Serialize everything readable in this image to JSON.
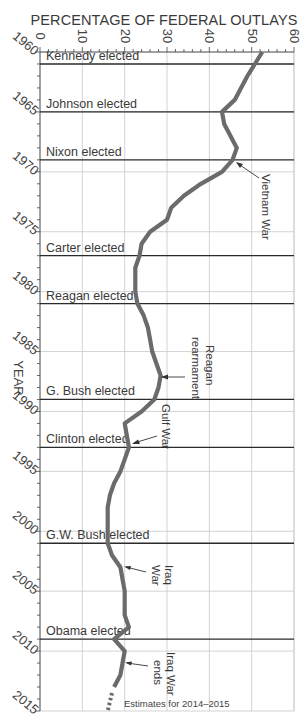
{
  "chart_data": {
    "type": "line",
    "orientation": "vertical (years on y-axis, top to bottom; percentage on x-axis)",
    "title": "PERCENTAGE OF FEDERAL OUTLAYS",
    "xlabel": "PERCENTAGE OF FEDERAL OUTLAYS",
    "ylabel": "YEAR",
    "xlim": [
      0,
      60
    ],
    "ylim": [
      1960,
      2015
    ],
    "x_ticks": [
      "0",
      "10",
      "20",
      "30",
      "40",
      "50",
      "60"
    ],
    "y_ticks": [
      "1960",
      "1965",
      "1970",
      "1975",
      "1980",
      "1985",
      "1990",
      "1995",
      "2000",
      "2005",
      "2010",
      "2015"
    ],
    "grid": true,
    "series": [
      {
        "name": "Defense spending as percentage of federal outlays",
        "x": [
          1960,
          1962,
          1964,
          1965,
          1966,
          1967,
          1968,
          1969,
          1970,
          1971,
          1972,
          1973,
          1974,
          1975,
          1976,
          1977,
          1978,
          1979,
          1980,
          1981,
          1982,
          1983,
          1984,
          1985,
          1986,
          1987,
          1988,
          1989,
          1990,
          1991,
          1992,
          1993,
          1994,
          1995,
          1996,
          1997,
          1998,
          1999,
          2000,
          2001,
          2002,
          2003,
          2004,
          2005,
          2006,
          2007,
          2008,
          2009,
          2010,
          2011,
          2012,
          2013
        ],
        "values": [
          52.5,
          49,
          46,
          43,
          43.5,
          45,
          46.5,
          45.5,
          43,
          38,
          34,
          31,
          30,
          26,
          24,
          23.5,
          22.5,
          22.5,
          22.5,
          23,
          24.5,
          25.5,
          26,
          26.5,
          27.5,
          28.5,
          28,
          27,
          24,
          20,
          20.5,
          21,
          20,
          19,
          17.5,
          16.5,
          16,
          16,
          16,
          16,
          17,
          19,
          19.5,
          20,
          20,
          20,
          21,
          17.5,
          20,
          19.5,
          19,
          17.5
        ]
      },
      {
        "name": "Estimates for 2014–2015 (dashed)",
        "x": [
          2013.5,
          2015
        ],
        "values": [
          17,
          16
        ]
      }
    ],
    "reference_lines": [
      {
        "label": "Kennedy elected",
        "year": 1961
      },
      {
        "label": "Johnson elected",
        "year": 1965
      },
      {
        "label": "Nixon elected",
        "year": 1969
      },
      {
        "label": "Carter elected",
        "year": 1977
      },
      {
        "label": "Reagan elected",
        "year": 1981
      },
      {
        "label": "G. Bush elected",
        "year": 1989
      },
      {
        "label": "Clinton elected",
        "year": 1993
      },
      {
        "label": "G.W. Bush elected",
        "year": 2001
      },
      {
        "label": "Obama elected",
        "year": 2009
      }
    ],
    "annotations": [
      {
        "text": "Vietnam War",
        "year": 1969,
        "pct": 46.5
      },
      {
        "text": "Reagan rearmament",
        "year": 1987,
        "pct": 28.5
      },
      {
        "text": "Gulf War",
        "year": 1992.5,
        "pct": 21
      },
      {
        "text": "Iraq War",
        "year": 2003,
        "pct": 19
      },
      {
        "text": "Iraq War ends",
        "year": 2011,
        "pct": 20
      },
      {
        "text": "Estimates for 2014–2015",
        "year": 2014.8,
        "pct": 20
      }
    ]
  },
  "labels": {
    "title": "PERCENTAGE OF FEDERAL OUTLAYS",
    "ylabel": "YEAR",
    "vietnam": "Vietnam War",
    "reagan_1": "Reagan",
    "reagan_2": "rearmament",
    "gulf": "Gulf War",
    "iraq_1": "Iraq",
    "iraq_2": "War",
    "iraq_end_1": "Iraq War",
    "iraq_end_2": "ends",
    "estimates": "Estimates for 2014–2015"
  },
  "colors": {
    "curve": "#6b6b6b",
    "election_line": "#2a2a2a",
    "grid": "#c8c8c8",
    "text": "#3a3a3a"
  }
}
